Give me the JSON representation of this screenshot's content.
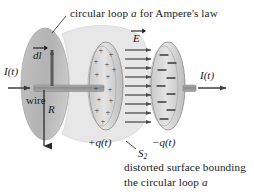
{
  "figure": {
    "title_top": "circular loop a for Ampere's law",
    "caption_line1": "distorted surface bounding",
    "caption_line2": "the circular loop a",
    "labels": {
      "current_left": "I(t)",
      "current_right": "I(t)",
      "wire": "wire",
      "dl_vector": "dl",
      "e_field": "E",
      "radius": "R",
      "charge_positive": "+q(t)",
      "charge_negative": "−q(t)",
      "surface": "S",
      "surface_subscript": "2"
    },
    "plate_signs": {
      "positive": "+",
      "negative": "−",
      "positive_count": 14,
      "negative_count": 9
    },
    "e_field_arrow_count": 9,
    "colors": {
      "background": "#ffffff",
      "text": "#1a1a1a",
      "loop_fill": "#b9b9b9",
      "surface_fill": "#e3e3e3",
      "plate_fill": "#d6d6d6",
      "plate_edge": "#8f8f8f",
      "wire_fill": "#9a9a9a",
      "arrow": "#4a4a4a"
    }
  }
}
